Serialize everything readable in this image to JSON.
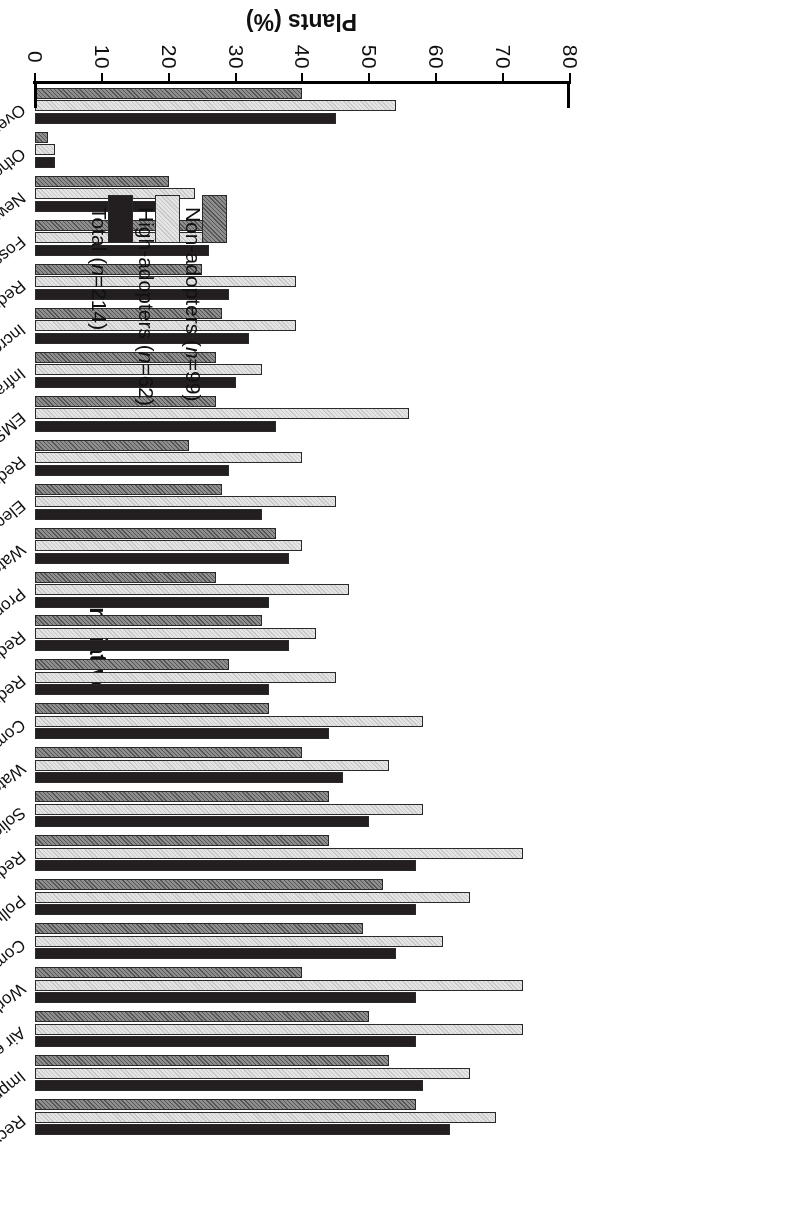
{
  "chart_data": {
    "type": "bar",
    "orientation": "vertical-grouped",
    "title": "",
    "xlabel": "Initiative",
    "ylabel": "Plants (%)",
    "ylim": [
      0,
      80
    ],
    "ytick_step": 10,
    "yticks": [
      "0",
      "10",
      "20",
      "30",
      "40",
      "50",
      "60",
      "70",
      "80"
    ],
    "grid": false,
    "legend_position": "top-left",
    "categories": [
      "Recycling ***",
      "Improved plant appearance*",
      "Air emission reduction***",
      "Worker health & safety",
      "Community health**",
      "Pollution prevention***",
      "Reduced dust**",
      "Solid waste reduction***",
      "Water pollution control*",
      "Community awareness**",
      "Reduced noise",
      "Reduced odor",
      "Property values**",
      "Water conservation",
      "Electricity use***",
      "Reduced traffic",
      "EMS***",
      "Infrastructure",
      "Increased water supply",
      "Reduced light pollution",
      "Fossil fuel use*",
      "New treatment infrastructure",
      "Other",
      "Overall impact"
    ],
    "series": [
      {
        "name": "Total (n=214)",
        "key": "total",
        "color": "#231f20",
        "pattern": "solid",
        "values": [
          62,
          58,
          57,
          57,
          54,
          57,
          57,
          50,
          46,
          44,
          35,
          38,
          35,
          38,
          34,
          29,
          36,
          30,
          32,
          29,
          26,
          21,
          3,
          45
        ]
      },
      {
        "name": "High-adopters (n=62)",
        "key": "high",
        "color": "#e4e4e4",
        "pattern": "fine-dots",
        "values": [
          69,
          65,
          73,
          73,
          61,
          65,
          73,
          58,
          53,
          58,
          45,
          42,
          47,
          40,
          45,
          40,
          56,
          34,
          39,
          39,
          26,
          24,
          3,
          54
        ]
      },
      {
        "name": "Non-adopters (n=99)",
        "key": "non",
        "color": "#8e8e8e",
        "pattern": "hatch",
        "values": [
          57,
          53,
          50,
          40,
          49,
          52,
          44,
          44,
          40,
          35,
          29,
          34,
          27,
          36,
          28,
          23,
          27,
          27,
          28,
          25,
          26,
          20,
          2,
          40
        ]
      }
    ]
  },
  "legend": {
    "entries": [
      {
        "label_prefix": "Non-adopters (",
        "n": "n",
        "label_suffix": "=99)",
        "full": "Non-adopters (n=99)",
        "swatch": "hatch"
      },
      {
        "label_prefix": "High-adopters (",
        "n": "n",
        "label_suffix": "=62)",
        "full": "High-adopters (n=62)",
        "swatch": "fine-dots"
      },
      {
        "label_prefix": "Total (",
        "n": "n",
        "label_suffix": "=214)",
        "full": "Total (n=214)",
        "swatch": "solid"
      }
    ]
  },
  "axes": {
    "value_axis_title": "Plants (%)",
    "category_axis_title": "Initiative"
  }
}
